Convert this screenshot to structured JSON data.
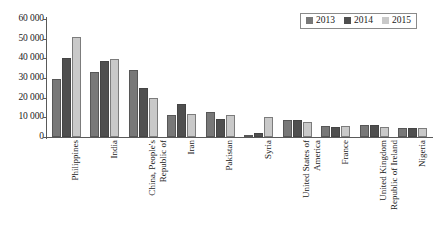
{
  "chart_data": {
    "type": "bar",
    "title": "",
    "xlabel": "",
    "ylabel": "",
    "ylim": [
      0,
      60000
    ],
    "ytick_labels": [
      "60 000",
      "50 000",
      "40 000",
      "30 000",
      "20 000",
      "10 000",
      "0"
    ],
    "ytick_values": [
      60000,
      50000,
      40000,
      30000,
      20000,
      10000,
      0
    ],
    "grid": false,
    "legend_position": "top-right",
    "categories": [
      "Philippines",
      "India",
      "China, People's\nRepublic of",
      "Iran",
      "Pakistan",
      "Syria",
      "United States of\nAmerica",
      "France",
      "United Kingdom\nRepublic of Ireland",
      "Nigeria"
    ],
    "series": [
      {
        "name": "2013",
        "color": "#787878",
        "values": [
          29500,
          33000,
          34200,
          11200,
          12600,
          900,
          8600,
          5700,
          5900,
          4700
        ]
      },
      {
        "name": "2014",
        "color": "#4f4f4f",
        "values": [
          40200,
          38500,
          24800,
          16800,
          9200,
          1900,
          8700,
          5200,
          5900,
          4700
        ]
      },
      {
        "name": "2015",
        "color": "#c9c9c9",
        "values": [
          51000,
          39500,
          19600,
          11600,
          11300,
          10000,
          7500,
          5700,
          5300,
          4500
        ]
      }
    ]
  }
}
